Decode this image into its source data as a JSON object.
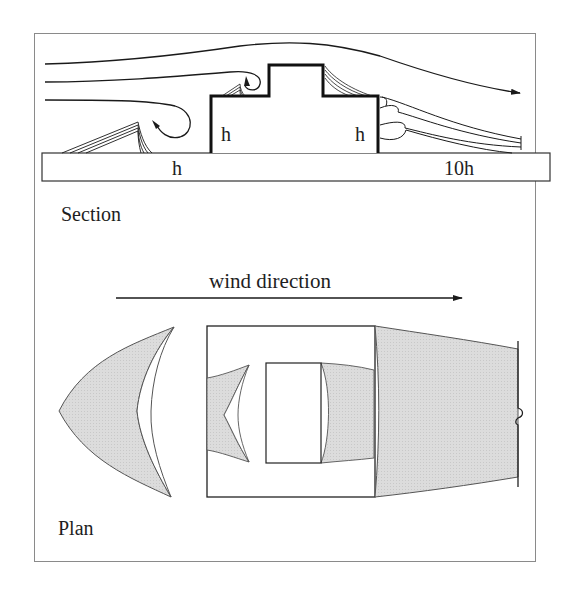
{
  "figure": {
    "section": {
      "title": "Section",
      "labels": {
        "building_left_height": "h",
        "building_right_height": "h",
        "upwind_distance": "h",
        "downwind_distance": "10h"
      }
    },
    "plan": {
      "title": "Plan",
      "wind_label": "wind direction"
    }
  },
  "colors": {
    "line": "#1a1a1a",
    "frame": "#8a8a8a",
    "shade": "#d9d9d9",
    "background": "#ffffff"
  }
}
